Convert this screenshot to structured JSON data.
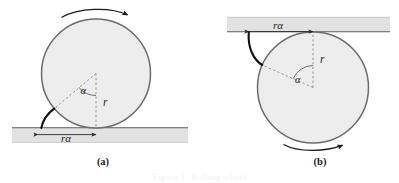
{
  "figure": {
    "caption_partial": "Figure 1. Rolling wheel",
    "background_color": "#ffffff",
    "ink_color": "#262626",
    "surface_fill": "#e0e0e0",
    "surface_stroke": "#9a9a9a",
    "disk_fill": "#ededed",
    "disk_stroke": "#6e6e6e",
    "dashed_color": "#8c8c8c",
    "curve_color": "#111111"
  },
  "panels": [
    {
      "id": "a",
      "caption": "(a)",
      "caption_x": 103,
      "caption_y": 164,
      "disk": {
        "cx": 96,
        "cy": 73.5,
        "r": 54.5
      },
      "surface": {
        "x": 12,
        "y": 127.5,
        "width": 176,
        "height": 15,
        "orientation": "horizontal-below"
      },
      "radius_label": {
        "text": "r",
        "x": 103,
        "y": 106
      },
      "angle_label": {
        "text": "α",
        "x": 85,
        "y": 93
      },
      "arc_label": {
        "text": "rα",
        "x": 90,
        "y": 140
      },
      "arc_measure": {
        "from_x": 38,
        "to_x": 96,
        "y": 134.5
      },
      "rotation_arrow": {
        "direction": "clockwise",
        "position": "above-disk"
      },
      "contact_point": {
        "x": 96,
        "y": 128
      },
      "angle_deg": 50
    },
    {
      "id": "b",
      "caption": "(b)",
      "caption_x": 320,
      "caption_y": 164,
      "disk": {
        "cx": 313,
        "cy": 87.5,
        "r": 55.5
      },
      "surface": {
        "x": 227,
        "y": 17,
        "width": 163,
        "height": 15,
        "orientation": "horizontal-above"
      },
      "radius_label": {
        "text": "r",
        "x": 321,
        "y": 62
      },
      "angle_label": {
        "text": "α",
        "x": 299,
        "y": 82
      },
      "arc_label": {
        "text": "rα",
        "x": 280,
        "y": 28
      },
      "arc_measure": {
        "from_x": 249,
        "to_x": 313,
        "y": 32
      },
      "rotation_arrow": {
        "direction": "clockwise",
        "position": "below-disk"
      },
      "contact_point": {
        "x": 313,
        "y": 32
      },
      "angle_deg": 50
    }
  ],
  "symbols": {
    "radius": "r",
    "alpha": "α",
    "arc_length": "rα"
  }
}
